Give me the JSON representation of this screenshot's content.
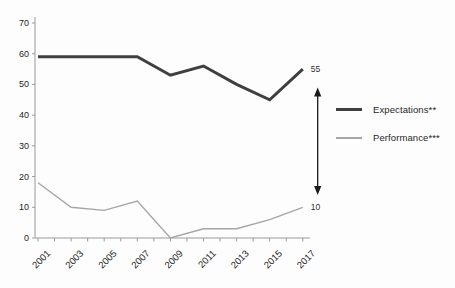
{
  "chart_data": {
    "type": "line",
    "title": "",
    "xlabel": "",
    "ylabel": "",
    "x": [
      2001,
      2003,
      2005,
      2007,
      2009,
      2011,
      2013,
      2015,
      2017
    ],
    "x_minor_tick_every_year": true,
    "x_range": [
      2001,
      2017
    ],
    "ylim": [
      0,
      70
    ],
    "yticks": [
      0,
      10,
      20,
      30,
      40,
      50,
      60,
      70
    ],
    "grid": false,
    "legend_position": "right",
    "series": [
      {
        "name": "Expectations**",
        "values": [
          59,
          59,
          59,
          59,
          53,
          56,
          50,
          45,
          55
        ],
        "color": "#3f3f3f",
        "stroke_width": 3,
        "end_label": "55"
      },
      {
        "name": "Performance***",
        "values": [
          18,
          10,
          9,
          12,
          0,
          3,
          3,
          6,
          10
        ],
        "color": "#a6a6a6",
        "stroke_width": 1.4,
        "end_label": "10"
      }
    ],
    "annotations": {
      "gap_arrow": {
        "description": "vertical double-headed arrow between series end values",
        "x_year": 2017.9,
        "top_value": 49,
        "bottom_value": 14,
        "color": "#1a1a1a"
      }
    }
  },
  "colors": {
    "background": "#fdfdfd",
    "axis": "#9a9a9a",
    "tick_text": "#262626"
  }
}
